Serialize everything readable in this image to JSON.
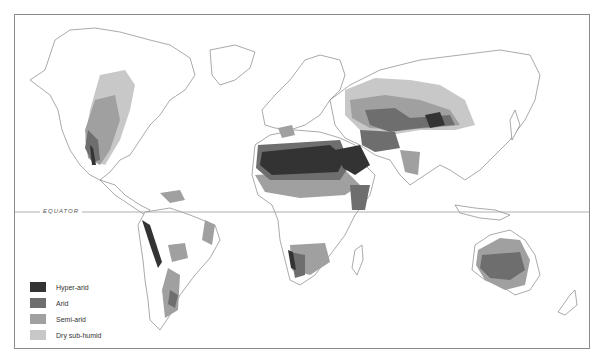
{
  "map": {
    "equator_label": "EQUATOR",
    "colors": {
      "hyper_arid": "#333333",
      "arid": "#6e6e6e",
      "semi_arid": "#a0a0a0",
      "dry_sub_humid": "#c8c8c8",
      "coastline": "#707070",
      "frame": "#8a8a8a"
    }
  },
  "legend": {
    "items": [
      {
        "label": "Hyper-arid",
        "color": "#333333"
      },
      {
        "label": "Arid",
        "color": "#6e6e6e"
      },
      {
        "label": "Semi-arid",
        "color": "#a0a0a0"
      },
      {
        "label": "Dry sub-humid",
        "color": "#c8c8c8"
      }
    ]
  }
}
